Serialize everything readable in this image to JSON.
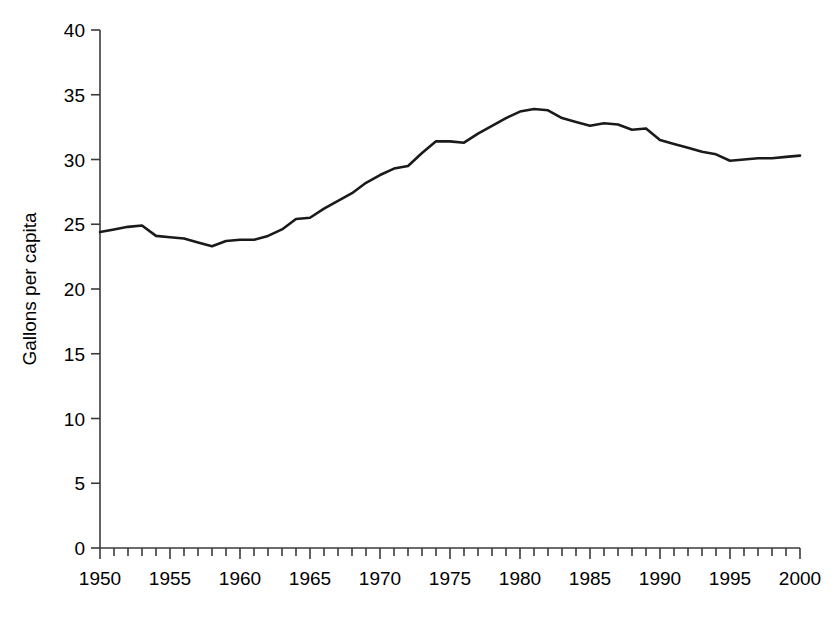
{
  "chart_data": {
    "type": "line",
    "title": "",
    "xlabel": "",
    "ylabel": "Gallons per capita",
    "xlim": [
      1950,
      2000
    ],
    "ylim": [
      0,
      40
    ],
    "grid": false,
    "legend": "none",
    "x_tick_labels": [
      "1950",
      "1955",
      "1960",
      "1965",
      "1970",
      "1975",
      "1980",
      "1985",
      "1990",
      "1995",
      "2000"
    ],
    "x_tick_values": [
      1950,
      1955,
      1960,
      1965,
      1970,
      1975,
      1980,
      1985,
      1990,
      1995,
      2000
    ],
    "x_minor_tick_interval": 1,
    "y_tick_labels": [
      "0",
      "5",
      "10",
      "15",
      "20",
      "25",
      "30",
      "35",
      "40"
    ],
    "y_tick_values": [
      0,
      5,
      10,
      15,
      20,
      25,
      30,
      35,
      40
    ],
    "line_color": "#1a1a1a",
    "line_width": 2.6,
    "x": [
      1950,
      1951,
      1952,
      1953,
      1954,
      1955,
      1956,
      1957,
      1958,
      1959,
      1960,
      1961,
      1962,
      1963,
      1964,
      1965,
      1966,
      1967,
      1968,
      1969,
      1970,
      1971,
      1972,
      1973,
      1974,
      1975,
      1976,
      1977,
      1978,
      1979,
      1980,
      1981,
      1982,
      1983,
      1984,
      1985,
      1986,
      1987,
      1988,
      1989,
      1990,
      1991,
      1992,
      1993,
      1994,
      1995,
      1996,
      1997,
      1998,
      1999,
      2000
    ],
    "values": [
      24.4,
      24.6,
      24.8,
      24.9,
      24.1,
      24.0,
      23.9,
      23.6,
      23.3,
      23.7,
      23.8,
      23.8,
      24.1,
      24.6,
      25.4,
      25.5,
      26.2,
      26.8,
      27.4,
      28.2,
      28.8,
      29.3,
      29.5,
      30.5,
      31.4,
      31.4,
      31.3,
      32.0,
      32.6,
      33.2,
      33.7,
      33.9,
      33.8,
      33.2,
      32.9,
      32.6,
      32.8,
      32.7,
      32.3,
      32.4,
      31.5,
      31.2,
      30.9,
      30.6,
      30.4,
      29.9,
      30.0,
      30.1,
      30.1,
      30.2,
      30.3
    ],
    "series": [
      {
        "name": "Gallons per capita",
        "values": [
          24.4,
          24.6,
          24.8,
          24.9,
          24.1,
          24.0,
          23.9,
          23.6,
          23.3,
          23.7,
          23.8,
          23.8,
          24.1,
          24.6,
          25.4,
          25.5,
          26.2,
          26.8,
          27.4,
          28.2,
          28.8,
          29.3,
          29.5,
          30.5,
          31.4,
          31.4,
          31.3,
          32.0,
          32.6,
          33.2,
          33.7,
          33.9,
          33.8,
          33.2,
          32.9,
          32.6,
          32.8,
          32.7,
          32.3,
          32.4,
          31.5,
          31.2,
          30.9,
          30.6,
          30.4,
          29.9,
          30.0,
          30.1,
          30.1,
          30.2,
          30.3
        ]
      }
    ],
    "peak": {
      "year": 1981,
      "value": 33.9
    },
    "minimum": {
      "year": 1958,
      "value": 23.3
    },
    "start": {
      "year": 1950,
      "value": 24.4
    },
    "end": {
      "year": 2000,
      "value": 30.3
    }
  }
}
